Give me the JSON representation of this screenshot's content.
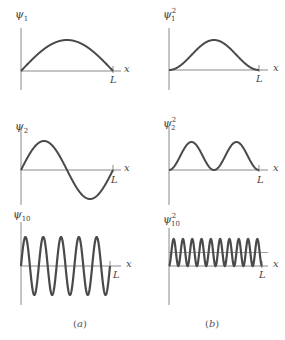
{
  "colors": {
    "curve": "#4a4a4a",
    "axis": "#8a8a8a",
    "text": "#444444"
  },
  "axis_labels": {
    "x": "x",
    "L": "L"
  },
  "columns": [
    {
      "caption_open": "(",
      "caption_letter": "a",
      "caption_close": ")",
      "panels": [
        {
          "symbol": "ψ",
          "sub": "1",
          "sup": "",
          "n": 1,
          "squared": false
        },
        {
          "symbol": "ψ",
          "sub": "2",
          "sup": "",
          "n": 2,
          "squared": false
        },
        {
          "symbol": "ψ",
          "sub": "10",
          "sup": "",
          "n": 10,
          "squared": false
        }
      ]
    },
    {
      "caption_open": "(",
      "caption_letter": "b",
      "caption_close": ")",
      "panels": [
        {
          "symbol": "ψ",
          "sub": "1",
          "sup": "2",
          "n": 1,
          "squared": true
        },
        {
          "symbol": "ψ",
          "sub": "2",
          "sup": "2",
          "n": 2,
          "squared": true
        },
        {
          "symbol": "ψ",
          "sub": "10",
          "sup": "2",
          "n": 10,
          "squared": true
        }
      ]
    }
  ]
}
